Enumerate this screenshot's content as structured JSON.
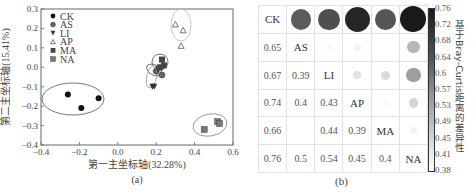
{
  "panel_a": {
    "caption": "(a)",
    "xlabel": "第一主坐标轴(32.28%)",
    "ylabel": "第二主坐标轴(15.41%)",
    "xticks": [
      "-0.4",
      "-0.2",
      "0.0",
      "0.2",
      "0.4",
      "0.6"
    ],
    "yticks": [
      "0.3",
      "0.2",
      "0.1",
      "0.0",
      "-0.1",
      "-0.2",
      "-0.3",
      "-0.4"
    ],
    "legend": [
      {
        "label": "CK",
        "marker": "filled-circle"
      },
      {
        "label": "AS",
        "marker": "gray-circle"
      },
      {
        "label": "LI",
        "marker": "filled-down-triangle"
      },
      {
        "label": "AP",
        "marker": "open-up-triangle"
      },
      {
        "label": "MA",
        "marker": "dark-square"
      },
      {
        "label": "NA",
        "marker": "gray-square"
      }
    ]
  },
  "panel_b": {
    "caption": "(b)",
    "labels": [
      "CK",
      "AS",
      "LI",
      "AP",
      "MA",
      "NA"
    ],
    "lower_values": [
      [
        "",
        "",
        "",
        "",
        "",
        ""
      ],
      [
        "0.65",
        "",
        "",
        "",
        "",
        ""
      ],
      [
        "0.67",
        "0.39",
        "",
        "",
        "",
        ""
      ],
      [
        "0.74",
        "0.4",
        "0.43",
        "",
        "",
        ""
      ],
      [
        "0.66",
        "",
        "0.44",
        "0.39",
        "",
        ""
      ],
      [
        "0.76",
        "0.5",
        "0.54",
        "0.45",
        "0.4",
        ""
      ]
    ],
    "colorbar_title": "基于Bray-Curtis距离的差异性",
    "colorbar_ticks": [
      "0.76",
      "0.72",
      "0.68",
      "0.64",
      "0.6",
      "0.57",
      "0.53",
      "0.49",
      "0.45",
      "0.41",
      "0.38"
    ]
  },
  "chart_data": [
    {
      "type": "scatter",
      "title": "(a)",
      "xlabel": "第一主坐标轴(32.28%)",
      "ylabel": "第二主坐标轴(15.41%)",
      "xlim": [
        -0.4,
        0.6
      ],
      "ylim": [
        -0.4,
        0.3
      ],
      "grid": false,
      "legend_position": "upper left",
      "series": [
        {
          "name": "CK",
          "points": [
            [
              -0.26,
              -0.14
            ],
            [
              -0.19,
              -0.21
            ],
            [
              -0.1,
              -0.16
            ]
          ]
        },
        {
          "name": "AS",
          "points": [
            [
              0.2,
              -0.02
            ],
            [
              0.23,
              -0.04
            ]
          ]
        },
        {
          "name": "LI",
          "points": [
            [
              0.18,
              -0.1
            ],
            [
              0.19,
              -0.1
            ],
            [
              0.21,
              -0.01
            ]
          ]
        },
        {
          "name": "AP",
          "points": [
            [
              0.3,
              0.22
            ],
            [
              0.34,
              0.19
            ],
            [
              0.33,
              0.11
            ]
          ]
        },
        {
          "name": "MA",
          "points": [
            [
              0.23,
              0.04
            ],
            [
              0.24,
              0.01
            ],
            [
              0.22,
              0.0
            ]
          ]
        },
        {
          "name": "NA",
          "points": [
            [
              0.45,
              -0.32
            ],
            [
              0.52,
              -0.28
            ],
            [
              0.53,
              -0.29
            ]
          ]
        }
      ]
    },
    {
      "type": "heatmap",
      "title": "(b)",
      "categories": [
        "CK",
        "AS",
        "LI",
        "AP",
        "MA",
        "NA"
      ],
      "colorbar_label": "基于Bray-Curtis距离的差异性",
      "colorbar_range": [
        0.38,
        0.76
      ],
      "colorbar_ticks": [
        0.76,
        0.72,
        0.68,
        0.64,
        0.6,
        0.57,
        0.53,
        0.49,
        0.45,
        0.41,
        0.38
      ],
      "pairs": [
        {
          "a": "CK",
          "b": "AS",
          "value": 0.65
        },
        {
          "a": "CK",
          "b": "LI",
          "value": 0.67
        },
        {
          "a": "CK",
          "b": "AP",
          "value": 0.74
        },
        {
          "a": "CK",
          "b": "MA",
          "value": 0.66
        },
        {
          "a": "CK",
          "b": "NA",
          "value": 0.76
        },
        {
          "a": "AS",
          "b": "LI",
          "value": 0.39
        },
        {
          "a": "AS",
          "b": "AP",
          "value": 0.4
        },
        {
          "a": "AS",
          "b": "MA",
          "value": null
        },
        {
          "a": "AS",
          "b": "NA",
          "value": 0.5
        },
        {
          "a": "LI",
          "b": "AP",
          "value": 0.43
        },
        {
          "a": "LI",
          "b": "MA",
          "value": 0.44
        },
        {
          "a": "LI",
          "b": "NA",
          "value": 0.54
        },
        {
          "a": "AP",
          "b": "MA",
          "value": 0.39
        },
        {
          "a": "AP",
          "b": "NA",
          "value": 0.45
        },
        {
          "a": "MA",
          "b": "NA",
          "value": 0.4
        }
      ]
    }
  ]
}
